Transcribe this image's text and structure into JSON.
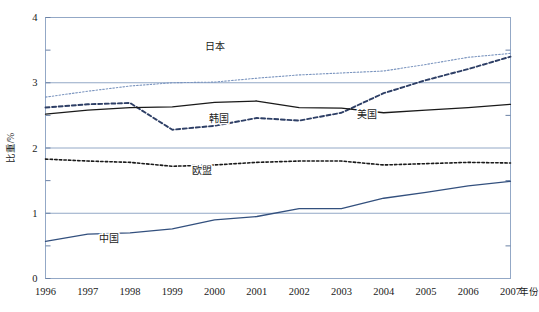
{
  "chart_data": {
    "type": "line",
    "title": "",
    "xlabel": "年份",
    "ylabel": "比重/%",
    "x": [
      1996,
      1997,
      1998,
      1999,
      2000,
      2001,
      2002,
      2003,
      2004,
      2005,
      2006,
      2007
    ],
    "categories": [
      "1996",
      "1997",
      "1998",
      "1999",
      "2000",
      "2001",
      "2002",
      "2003",
      "2004",
      "2005",
      "2006",
      "2007"
    ],
    "xlim": [
      1996,
      2007
    ],
    "ylim": [
      0,
      4
    ],
    "y_ticks": [
      "0",
      "1",
      "2",
      "3",
      "4"
    ],
    "y_tick_values": [
      0,
      1,
      2,
      3,
      4
    ],
    "y_minor_tick_values": [
      0.5,
      1.5,
      2.5,
      3.5
    ],
    "grid": "horizontal-major",
    "legend": "inline-annotations",
    "series": [
      {
        "name": "日本",
        "style": "fine-dotted",
        "color": "#7b95bf",
        "values": [
          2.78,
          2.87,
          2.95,
          3.0,
          3.01,
          3.07,
          3.12,
          3.15,
          3.18,
          3.28,
          3.39,
          3.45
        ],
        "label_x": 2000.0,
        "label_y": 3.5
      },
      {
        "name": "韩国",
        "style": "bold-dashed",
        "color": "#2e3f66",
        "values": [
          2.62,
          2.67,
          2.69,
          2.28,
          2.34,
          2.46,
          2.42,
          2.54,
          2.84,
          3.04,
          3.21,
          3.4
        ],
        "label_x": 2000.1,
        "label_y": 2.4
      },
      {
        "name": "美国",
        "style": "solid",
        "color": "#1a1a1a",
        "values": [
          2.52,
          2.58,
          2.62,
          2.63,
          2.7,
          2.72,
          2.62,
          2.61,
          2.54,
          2.58,
          2.62,
          2.67
        ],
        "label_x": 2003.6,
        "label_y": 2.46
      },
      {
        "name": "欧盟",
        "style": "dotted",
        "color": "#1a1a1a",
        "values": [
          1.83,
          1.8,
          1.78,
          1.72,
          1.74,
          1.78,
          1.8,
          1.8,
          1.74,
          1.76,
          1.78,
          1.77
        ],
        "label_x": 1999.7,
        "label_y": 1.6
      },
      {
        "name": "中国",
        "style": "solid",
        "color": "#33507e",
        "values": [
          0.57,
          0.68,
          0.7,
          0.76,
          0.9,
          0.95,
          1.07,
          1.07,
          1.23,
          1.32,
          1.42,
          1.49
        ],
        "label_x": 1997.5,
        "label_y": 0.56
      }
    ]
  }
}
